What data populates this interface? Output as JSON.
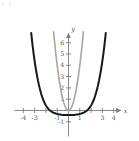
{
  "figure": {
    "corner_mark": "( )",
    "background_color": "#ffffff"
  },
  "chart_data": {
    "type": "line",
    "title": "",
    "subtitle": "",
    "xlabel": "x",
    "ylabel": "y",
    "xlim": [
      -4.8,
      5.0
    ],
    "ylim": [
      -2.3,
      7.2
    ],
    "grid": false,
    "legend": "none",
    "axis_color": "#7d7d7d",
    "x_ticks": [
      -4,
      -3,
      -2,
      -1,
      1,
      2,
      3,
      4
    ],
    "x_tick_labels": [
      "-4",
      "-3",
      "",
      "-1",
      "1",
      "",
      "3",
      "4"
    ],
    "y_ticks": [
      -1,
      1,
      2,
      3,
      4,
      5,
      6
    ],
    "y_tick_labels": [
      "-1",
      "1",
      "2",
      "3",
      "4",
      "5",
      "6"
    ],
    "series": [
      {
        "name": "wide-flat-quartic",
        "color": "#1a1a1a",
        "line_width": 2.0,
        "x": [
          -3.3,
          -3.2,
          -3.1,
          -3.0,
          -2.9,
          -2.8,
          -2.7,
          -2.6,
          -2.5,
          -2.4,
          -2.3,
          -2.2,
          -2.1,
          -2.0,
          -1.9,
          -1.8,
          -1.7,
          -1.6,
          -1.5,
          -1.4,
          -1.3,
          -1.2,
          -1.1,
          -1.0,
          -0.9,
          -0.8,
          -0.7,
          -0.6,
          -0.5,
          -0.4,
          -0.3,
          -0.2,
          -0.1,
          0.0,
          0.1,
          0.2,
          0.3,
          0.4,
          0.5,
          0.6,
          0.7,
          0.8,
          0.9,
          1.0,
          1.1,
          1.2,
          1.3,
          1.4,
          1.5,
          1.6,
          1.7,
          1.8,
          1.9,
          2.0,
          2.1,
          2.2,
          2.3,
          2.4,
          2.5,
          2.6,
          2.7,
          2.8,
          2.9,
          3.0,
          3.1,
          3.2,
          3.3
        ],
        "y": [
          6.86,
          5.95,
          5.13,
          4.4,
          3.74,
          3.16,
          2.64,
          2.18,
          1.78,
          1.43,
          1.12,
          0.86,
          0.64,
          0.45,
          0.29,
          0.16,
          0.05,
          -0.03,
          -0.1,
          -0.16,
          -0.2,
          -0.24,
          -0.28,
          -0.3,
          -0.33,
          -0.35,
          -0.36,
          -0.38,
          -0.39,
          -0.39,
          -0.4,
          -0.4,
          -0.4,
          -0.4,
          -0.4,
          -0.4,
          -0.4,
          -0.39,
          -0.39,
          -0.38,
          -0.36,
          -0.35,
          -0.33,
          -0.3,
          -0.28,
          -0.24,
          -0.2,
          -0.16,
          -0.1,
          -0.03,
          0.05,
          0.16,
          0.29,
          0.45,
          0.64,
          0.86,
          1.12,
          1.43,
          1.78,
          2.18,
          2.64,
          3.16,
          3.74,
          4.4,
          5.13,
          5.95,
          6.86
        ]
      },
      {
        "name": "narrow-parabola",
        "color": "#a6a6a6",
        "line_width": 1.6,
        "x": [
          -1.32,
          -1.25,
          -1.18,
          -1.11,
          -1.04,
          -0.97,
          -0.9,
          -0.83,
          -0.76,
          -0.69,
          -0.62,
          -0.55,
          -0.48,
          -0.41,
          -0.34,
          -0.27,
          -0.2,
          -0.13,
          -0.06,
          0.0,
          0.06,
          0.13,
          0.2,
          0.27,
          0.34,
          0.41,
          0.48,
          0.55,
          0.62,
          0.69,
          0.76,
          0.83,
          0.9,
          0.97,
          1.04,
          1.11,
          1.18,
          1.25,
          1.32
        ],
        "y": [
          6.97,
          6.25,
          5.57,
          4.93,
          4.33,
          3.76,
          3.24,
          2.76,
          2.31,
          1.9,
          1.54,
          1.21,
          0.92,
          0.67,
          0.46,
          0.29,
          0.16,
          0.07,
          0.01,
          0.0,
          0.01,
          0.07,
          0.16,
          0.29,
          0.46,
          0.67,
          0.92,
          1.21,
          1.54,
          1.9,
          2.31,
          2.76,
          3.24,
          3.76,
          4.33,
          4.93,
          5.57,
          6.25,
          6.97
        ]
      }
    ]
  }
}
